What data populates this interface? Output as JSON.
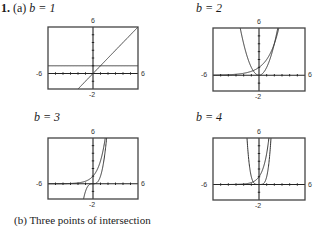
{
  "problem": {
    "number": "1.",
    "part_a": "(a)",
    "part_b": "(b)",
    "part_b_text": "Three points of intersection"
  },
  "colors": {
    "frame": "#444444",
    "curve": "#333333",
    "axis": "#222222"
  },
  "chart_data": [
    {
      "type": "line",
      "title": "b = 1",
      "b": 1,
      "xlim": [
        -6,
        6
      ],
      "ylim": [
        -2,
        6
      ],
      "tick_labels": {
        "xmin": "-6",
        "xmax": "6",
        "ymin": "-2",
        "ymax": "6"
      },
      "series": [
        {
          "name": "y = b^x",
          "expr": "1"
        },
        {
          "name": "y = x^b",
          "expr": "x"
        }
      ]
    },
    {
      "type": "line",
      "title": "b = 2",
      "b": 2,
      "xlim": [
        -6,
        6
      ],
      "ylim": [
        -2,
        6
      ],
      "tick_labels": {
        "xmin": "-6",
        "xmax": "6",
        "ymin": "-2",
        "ymax": "6"
      },
      "series": [
        {
          "name": "y = b^x",
          "expr": "2^x"
        },
        {
          "name": "y = x^b",
          "expr": "x^2"
        }
      ]
    },
    {
      "type": "line",
      "title": "b = 3",
      "b": 3,
      "xlim": [
        -6,
        6
      ],
      "ylim": [
        -2,
        6
      ],
      "tick_labels": {
        "xmin": "-6",
        "xmax": "6",
        "ymin": "-2",
        "ymax": "6"
      },
      "series": [
        {
          "name": "y = b^x",
          "expr": "3^x"
        },
        {
          "name": "y = x^b",
          "expr": "x^3"
        }
      ]
    },
    {
      "type": "line",
      "title": "b = 4",
      "b": 4,
      "xlim": [
        -6,
        6
      ],
      "ylim": [
        -2,
        6
      ],
      "tick_labels": {
        "xmin": "-6",
        "xmax": "6",
        "ymin": "-2",
        "ymax": "6"
      },
      "series": [
        {
          "name": "y = b^x",
          "expr": "4^x"
        },
        {
          "name": "y = x^b",
          "expr": "x^4"
        }
      ]
    }
  ],
  "labels": {
    "b1": "b = 1",
    "b2": "b = 2",
    "b3": "b = 3",
    "b4": "b = 4"
  }
}
